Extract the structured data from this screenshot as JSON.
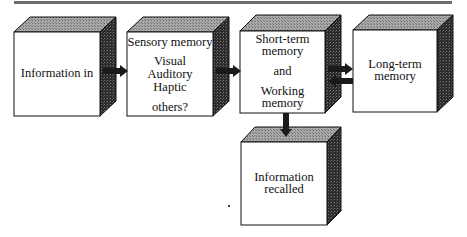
{
  "diagram": {
    "title": "",
    "colors": {
      "front": "#ffffff",
      "top": "#9a9a9a",
      "side": "#2a2a2a",
      "outline": "#111111",
      "rule": "#6e6e6e"
    },
    "nodes": [
      {
        "id": "information-in",
        "lines": [
          "Information in"
        ]
      },
      {
        "id": "sensory-memory",
        "heading": "Sensory memory",
        "lines": [
          "Visual",
          "Auditory",
          "Haptic",
          "",
          "others?"
        ]
      },
      {
        "id": "short-term-memory",
        "lines": [
          "Short-term",
          "memory",
          "",
          "and",
          "",
          "Working",
          "memory"
        ]
      },
      {
        "id": "long-term-memory",
        "lines": [
          "Long-term",
          "memory"
        ]
      },
      {
        "id": "information-recalled",
        "lines": [
          "Information",
          "recalled"
        ]
      }
    ],
    "edges": [
      {
        "from": "information-in",
        "to": "sensory-memory"
      },
      {
        "from": "sensory-memory",
        "to": "short-term-memory"
      },
      {
        "from": "short-term-memory",
        "to": "long-term-memory"
      },
      {
        "from": "long-term-memory",
        "to": "short-term-memory"
      },
      {
        "from": "short-term-memory",
        "to": "information-recalled"
      }
    ]
  },
  "text": {
    "n1": "Information in",
    "n2_head": "Sensory memory",
    "n2_l1": "Visual",
    "n2_l2": "Auditory",
    "n2_l3": "Haptic",
    "n2_l4": "others?",
    "n3_l1": "Short-term",
    "n3_l2": "memory",
    "n3_l3": "and",
    "n3_l4": "Working",
    "n3_l5": "memory",
    "n4_l1": "Long-term",
    "n4_l2": "memory",
    "n5_l1": "Information",
    "n5_l2": "recalled"
  }
}
